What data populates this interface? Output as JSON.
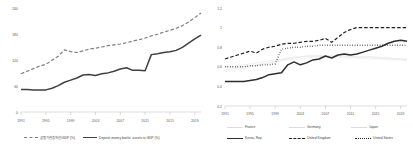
{
  "chart_data": [
    {
      "type": "line",
      "panel": "left",
      "title": "",
      "xlabel": "",
      "ylabel": "",
      "xlim": [
        1991,
        2020
      ],
      "ylim": [
        0,
        240
      ],
      "yticks": [
        "0",
        "60",
        "120",
        "180",
        "240"
      ],
      "ytick_values": [
        0,
        60,
        120,
        180,
        240
      ],
      "xticks": [
        "1991",
        "1995",
        "1999",
        "2003",
        "2007",
        "2011",
        "2015",
        "2019"
      ],
      "xtick_values": [
        1991,
        1995,
        1999,
        2003,
        2007,
        2011,
        2015,
        2019
      ],
      "grid": false,
      "legend_position": "bottom",
      "x": [
        1991,
        1992,
        1993,
        1994,
        1995,
        1996,
        1997,
        1998,
        1999,
        2000,
        2001,
        2002,
        2003,
        2004,
        2005,
        2006,
        2007,
        2008,
        2009,
        2010,
        2011,
        2012,
        2013,
        2014,
        2015,
        2016,
        2017,
        2018,
        2019,
        2020
      ],
      "series": [
        {
          "name": "금융기관총자산/GDP (%)",
          "style": "dashed",
          "color": "#7f7f7f",
          "values": [
            90,
            96,
            102,
            108,
            112,
            122,
            131,
            146,
            142,
            140,
            144,
            148,
            150,
            153,
            156,
            158,
            160,
            163,
            167,
            170,
            174,
            179,
            183,
            188,
            192,
            197,
            203,
            212,
            222,
            233
          ]
        },
        {
          "name": "Deposit money banks' assets to GDP (%)",
          "style": "solid",
          "color": "#404040",
          "values": [
            53,
            53,
            52,
            52,
            52,
            56,
            62,
            70,
            75,
            80,
            87,
            88,
            86,
            90,
            92,
            96,
            101,
            104,
            98,
            98,
            97,
            135,
            137,
            140,
            142,
            145,
            152,
            162,
            172,
            181
          ]
        }
      ]
    },
    {
      "type": "line",
      "panel": "right",
      "title": "",
      "xlabel": "",
      "ylabel": "",
      "xlim": [
        1991,
        2020
      ],
      "ylim": [
        0.2,
        1.2
      ],
      "yticks": [
        "0.2",
        "0.4",
        "0.6",
        "0.8",
        "1",
        "1.2"
      ],
      "ytick_values": [
        0.2,
        0.4,
        0.6,
        0.8,
        1.0,
        1.2
      ],
      "xticks": [
        "1991",
        "1995",
        "1999",
        "2003",
        "2007",
        "2011",
        "2015",
        "2019"
      ],
      "xtick_values": [
        1991,
        1995,
        1999,
        2003,
        2007,
        2011,
        2015,
        2019
      ],
      "grid": false,
      "legend_position": "bottom",
      "x": [
        1991,
        1992,
        1993,
        1994,
        1995,
        1996,
        1997,
        1998,
        1999,
        2000,
        2001,
        2002,
        2003,
        2004,
        2005,
        2006,
        2007,
        2008,
        2009,
        2010,
        2011,
        2012,
        2013,
        2014,
        2015,
        2016,
        2017,
        2018,
        2019,
        2020
      ],
      "series": [
        {
          "name": "France",
          "style": "solid-faint",
          "color": "#e2e2e2",
          "values": [
            0.57,
            0.58,
            0.59,
            0.6,
            0.61,
            0.62,
            0.63,
            0.64,
            0.66,
            0.67,
            0.68,
            0.69,
            0.7,
            0.71,
            0.71,
            0.71,
            0.71,
            0.71,
            0.71,
            0.71,
            0.71,
            0.7,
            0.7,
            0.7,
            0.7,
            0.69,
            0.69,
            0.68,
            0.68,
            0.67
          ]
        },
        {
          "name": "Germany",
          "style": "solid-faint",
          "color": "#ededed",
          "values": [
            0.55,
            0.56,
            0.57,
            0.58,
            0.6,
            0.61,
            0.62,
            0.63,
            0.65,
            0.66,
            0.67,
            0.68,
            0.68,
            0.69,
            0.7,
            0.7,
            0.7,
            0.7,
            0.7,
            0.69,
            0.69,
            0.69,
            0.68,
            0.68,
            0.68,
            0.68,
            0.67,
            0.67,
            0.67,
            0.66
          ]
        },
        {
          "name": "Japan",
          "style": "solid-faint",
          "color": "#e8e8e8",
          "values": [
            0.6,
            0.6,
            0.61,
            0.62,
            0.63,
            0.64,
            0.65,
            0.66,
            0.67,
            0.68,
            0.69,
            0.7,
            0.7,
            0.71,
            0.71,
            0.71,
            0.71,
            0.71,
            0.71,
            0.71,
            0.7,
            0.7,
            0.7,
            0.7,
            0.69,
            0.69,
            0.69,
            0.68,
            0.68,
            0.68
          ]
        },
        {
          "name": "Korea, Rep.",
          "style": "solid",
          "color": "#2e2e2e",
          "values": [
            0.45,
            0.45,
            0.45,
            0.45,
            0.46,
            0.47,
            0.49,
            0.52,
            0.53,
            0.54,
            0.62,
            0.65,
            0.62,
            0.64,
            0.67,
            0.68,
            0.71,
            0.69,
            0.72,
            0.73,
            0.72,
            0.73,
            0.75,
            0.77,
            0.79,
            0.81,
            0.84,
            0.86,
            0.87,
            0.86
          ]
        },
        {
          "name": "United Kingdom",
          "style": "dashed",
          "color": "#1f1f1f",
          "values": [
            0.68,
            0.7,
            0.72,
            0.74,
            0.76,
            0.74,
            0.78,
            0.8,
            0.81,
            0.83,
            0.84,
            0.84,
            0.85,
            0.86,
            0.86,
            0.87,
            0.89,
            0.85,
            0.9,
            0.95,
            0.98,
            1.0,
            1.0,
            1.0,
            1.0,
            1.0,
            1.0,
            1.0,
            1.0,
            1.0
          ]
        },
        {
          "name": "United States",
          "style": "dotted",
          "color": "#1f1f1f",
          "values": [
            0.6,
            0.6,
            0.6,
            0.6,
            0.61,
            0.61,
            0.62,
            0.62,
            0.63,
            0.78,
            0.79,
            0.8,
            0.8,
            0.81,
            0.81,
            0.82,
            0.82,
            0.82,
            0.82,
            0.82,
            0.82,
            0.82,
            0.82,
            0.82,
            0.82,
            0.82,
            0.82,
            0.82,
            0.82,
            0.82
          ]
        }
      ]
    }
  ],
  "left_chart": {
    "yticks": [
      "240",
      "180",
      "120",
      "60",
      "0"
    ],
    "xticks": [
      "1991",
      "1995",
      "1999",
      "2003",
      "2007",
      "2011",
      "2015",
      "2019"
    ],
    "legend": [
      {
        "label": "금융기관총자산/GDP (%)",
        "marker": "dashed-line"
      },
      {
        "label": "Deposit money banks' assets to GDP (%)",
        "marker": "solid-line"
      }
    ]
  },
  "right_chart": {
    "yticks": [
      "1.2",
      "1",
      "0.8",
      "0.6",
      "0.4",
      "0.2"
    ],
    "xticks": [
      "1991",
      "1995",
      "1999",
      "2003",
      "2007",
      "2011",
      "2015",
      "2019"
    ],
    "legend_row1": [
      {
        "label": "France",
        "marker": "faint-line"
      },
      {
        "label": "Germany",
        "marker": "faint-line"
      },
      {
        "label": "Japan",
        "marker": "faint-line"
      }
    ],
    "legend_row2": [
      {
        "label": "Korea, Rep.",
        "marker": "solid-line"
      },
      {
        "label": "United Kingdom",
        "marker": "dashed-line"
      },
      {
        "label": "United States",
        "marker": "dotted-line"
      }
    ]
  }
}
